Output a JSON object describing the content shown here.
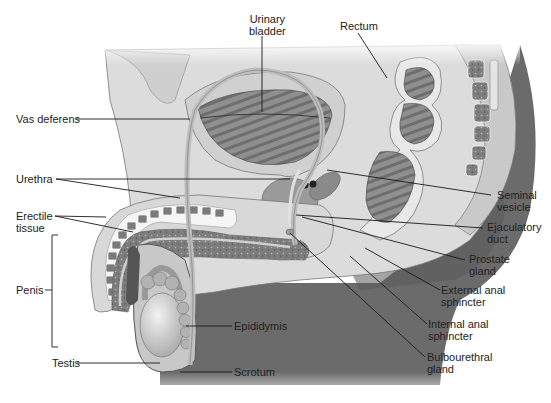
{
  "diagram": {
    "palette": {
      "background": "#ffffff",
      "tissue_light": "#e2e2e2",
      "tissue_mid": "#bdbdbd",
      "tissue_dark": "#8a8a8a",
      "skin_shadow": "#6a6a6a",
      "leader_line": "#1a1a1a",
      "label_text": "#222222"
    },
    "labels": {
      "urinary_bladder": [
        "Urinary",
        "bladder"
      ],
      "rectum": [
        "Rectum"
      ],
      "vas_deferens": [
        "Vas deferens"
      ],
      "urethra": [
        "Urethra"
      ],
      "seminal_vesicle": [
        "Seminal",
        "vesicle"
      ],
      "erectile_tissue": [
        "Erectile",
        "tissue"
      ],
      "ejaculatory_duct": [
        "Ejaculatory",
        "duct"
      ],
      "prostate_gland": [
        "Prostate",
        "gland"
      ],
      "penis": [
        "Penis"
      ],
      "external_anal_sphincter": [
        "External anal",
        "sphincter"
      ],
      "epididymis": [
        "Epididymis"
      ],
      "internal_anal_sphincter": [
        "Internal anal",
        "sphincter"
      ],
      "testis": [
        "Testis"
      ],
      "scrotum": [
        "Scrotum"
      ],
      "bulbourethral_gland": [
        "Bulbourethral",
        "gland"
      ]
    }
  }
}
